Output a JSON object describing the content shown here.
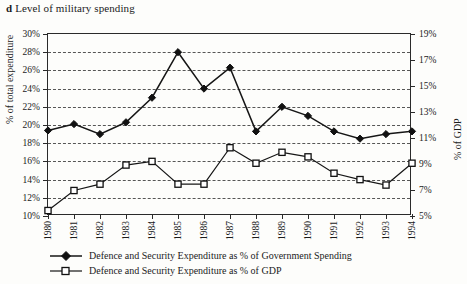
{
  "figure": {
    "panel_letter": "d",
    "title": "Level of military spending"
  },
  "axes": {
    "left_title": "% of total expenditure",
    "right_title": "% of GDP",
    "left_ticks": [
      "10%",
      "12%",
      "14%",
      "16%",
      "18%",
      "20%",
      "22%",
      "24%",
      "26%",
      "28%",
      "30%"
    ],
    "right_ticks": [
      "5%",
      "7%",
      "9%",
      "11%",
      "13%",
      "15%",
      "17%",
      "19%"
    ],
    "x_ticks": [
      "1980",
      "1981",
      "1982",
      "1983",
      "1984",
      "1985",
      "1986",
      "1987",
      "1988",
      "1989",
      "1990",
      "1991",
      "1992",
      "1993",
      "1994"
    ]
  },
  "legend": {
    "items": [
      {
        "label": "Defence and Security Expenditure as % of Government Spending",
        "marker": "filled-diamond"
      },
      {
        "label": "Defence and Security Expenditure as % of GDP",
        "marker": "open-square"
      }
    ]
  },
  "chart_data": {
    "type": "line",
    "title": "Level of military spending",
    "xlabel": "",
    "ylabel": "% of total expenditure",
    "y2label": "% of GDP",
    "grid": true,
    "legend_position": "bottom-left",
    "x": [
      1980,
      1981,
      1982,
      1983,
      1984,
      1985,
      1986,
      1987,
      1988,
      1989,
      1990,
      1991,
      1992,
      1993,
      1994
    ],
    "categories": [
      "1980",
      "1981",
      "1982",
      "1983",
      "1984",
      "1985",
      "1986",
      "1987",
      "1988",
      "1989",
      "1990",
      "1991",
      "1992",
      "1993",
      "1994"
    ],
    "ylim": [
      10,
      30
    ],
    "y2lim": [
      5,
      19
    ],
    "ytick_step": 2,
    "y2tick_step": 2,
    "series": [
      {
        "name": "Defence and Security Expenditure as % of Government Spending",
        "axis": "left",
        "marker": "filled-diamond",
        "values": [
          19.4,
          20.1,
          19.0,
          20.3,
          23.0,
          28.0,
          24.0,
          26.3,
          19.3,
          22.0,
          21.0,
          19.3,
          18.5,
          19.0,
          19.3
        ],
        "units": "% of total expenditure"
      },
      {
        "name": "Defence and Security Expenditure as % of GDP",
        "axis": "right",
        "marker": "open-square",
        "values": [
          5.4,
          7.0,
          7.5,
          9.0,
          9.4,
          7.4,
          7.4,
          10.6,
          9.0,
          9.8,
          9.5,
          8.4,
          8.0,
          7.6,
          9.0
        ],
        "units": "% of GDP",
        "left_scale_equivalents": [
          10.6,
          12.8,
          13.5,
          15.6,
          16.0,
          13.5,
          13.5,
          17.5,
          15.8,
          17.0,
          16.5,
          14.7,
          14.0,
          13.4,
          15.8
        ]
      }
    ]
  },
  "colors": {
    "ink": "#161616",
    "frame": "#2a2a2a",
    "grid": "#3a3a3a",
    "paper": "#fdfdfb"
  }
}
